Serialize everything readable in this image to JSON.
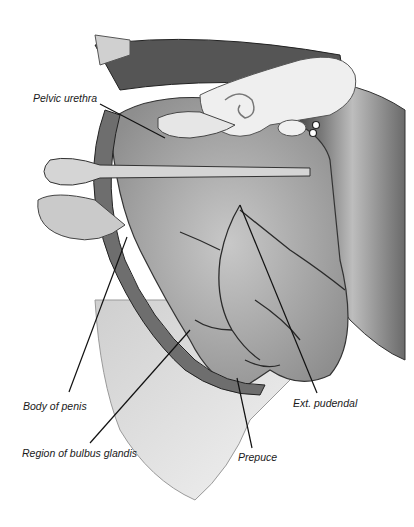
{
  "figure": {
    "colors": {
      "background": "#ffffff",
      "ink": "#1a1a1a",
      "tissue_dark": "#3a3a3a",
      "tissue_mid": "#8a8a8a",
      "tissue_light": "#d4d4d4",
      "bone": "#ececec"
    },
    "labels": [
      {
        "id": "pelvic-urethra",
        "text": "Pelvic urethra"
      },
      {
        "id": "body-of-penis",
        "text": "Body of penis"
      },
      {
        "id": "region-of-bulbus-glandis",
        "text": "Region of bulbus glandis"
      },
      {
        "id": "prepuce",
        "text": "Prepuce"
      },
      {
        "id": "ext-pudendal",
        "text": "Ext. pudendal"
      }
    ]
  }
}
